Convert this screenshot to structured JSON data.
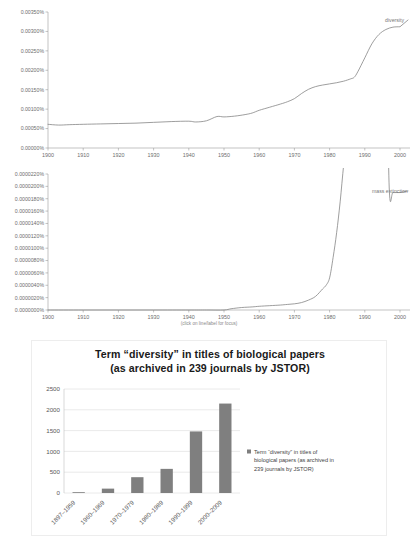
{
  "chart_data": [
    {
      "id": "ngram-diversity",
      "type": "line",
      "title": "",
      "xlabel": "",
      "ylabel": "",
      "caption": "",
      "legend": [
        "diversity"
      ],
      "legend_position": "right-inline",
      "grid": false,
      "xlim": [
        1900,
        2000
      ],
      "ylim": [
        0.0,
        0.0035
      ],
      "xticks": [
        "1900",
        "1910",
        "1920",
        "1930",
        "1940",
        "1950",
        "1960",
        "1970",
        "1980",
        "1990",
        "2000"
      ],
      "yticks": [
        "0.00000%",
        "0.00050%",
        "0.00100%",
        "0.00150%",
        "0.00200%",
        "0.00250%",
        "0.00300%",
        "0.00350%"
      ],
      "series": [
        {
          "name": "diversity",
          "x": [
            1900,
            1903,
            1906,
            1910,
            1915,
            1920,
            1925,
            1930,
            1935,
            1940,
            1942,
            1945,
            1948,
            1950,
            1953,
            1956,
            1958,
            1960,
            1963,
            1966,
            1968,
            1970,
            1972,
            1974,
            1976,
            1978,
            1980,
            1982,
            1984,
            1986,
            1987,
            1988,
            1990,
            1992,
            1994,
            1996,
            1998,
            2000
          ],
          "values": [
            0.00061,
            0.00059,
            0.0006,
            0.00061,
            0.00062,
            0.00063,
            0.00064,
            0.00066,
            0.00068,
            0.00069,
            0.00067,
            0.0007,
            0.00081,
            0.0008,
            0.00082,
            0.00086,
            0.0009,
            0.00097,
            0.00105,
            0.00113,
            0.00119,
            0.00127,
            0.0014,
            0.00151,
            0.00158,
            0.00162,
            0.00165,
            0.00168,
            0.00172,
            0.00178,
            0.00182,
            0.00196,
            0.00232,
            0.00268,
            0.00292,
            0.00305,
            0.00311,
            0.00312
          ]
        }
      ]
    },
    {
      "id": "ngram-mass-extinction",
      "type": "line",
      "title": "",
      "xlabel": "",
      "ylabel": "",
      "caption": "(click on line/label for focus)",
      "legend": [
        "mass extinction"
      ],
      "legend_position": "right-inline",
      "grid": false,
      "xlim": [
        1900,
        2000
      ],
      "ylim": [
        0.0,
        2.2e-06
      ],
      "xticks": [
        "1900",
        "1910",
        "1920",
        "1930",
        "1940",
        "1950",
        "1960",
        "1970",
        "1980",
        "1990",
        "2000"
      ],
      "yticks": [
        "0.0000000%",
        "0.0000020%",
        "0.0000040%",
        "0.0000060%",
        "0.0000080%",
        "0.0000100%",
        "0.0000120%",
        "0.0000140%",
        "0.0000160%",
        "0.0000180%",
        "0.0000200%",
        "0.0000220%"
      ],
      "series": [
        {
          "name": "mass extinction",
          "x": [
            1900,
            1910,
            1920,
            1930,
            1940,
            1945,
            1950,
            1952,
            1955,
            1958,
            1960,
            1963,
            1966,
            1968,
            1970,
            1972,
            1974,
            1976,
            1978,
            1979,
            1980,
            1981,
            1982,
            1983,
            1984,
            1985,
            1986,
            1987,
            1988,
            1990,
            1992,
            1994,
            1996,
            1997,
            1998,
            2000
          ],
          "values": [
            0.0,
            0.0,
            0.0,
            0.0,
            0.0,
            0.0,
            0.0,
            2e-08,
            4e-08,
            5e-08,
            6e-08,
            7e-08,
            8e-08,
            9e-08,
            1e-07,
            1.2e-07,
            1.6e-07,
            2.2e-07,
            3.4e-07,
            4e-07,
            5.2e-07,
            8.5e-07,
            1.25e-06,
            1.75e-06,
            2.35e-06,
            2.85e-06,
            3.2e-06,
            3.45e-06,
            3.62e-06,
            3.78e-06,
            3.82e-06,
            3.85e-06,
            3.9e-06,
            1.9e-06,
            1.9e-06,
            1.9e-06
          ]
        }
      ]
    },
    {
      "id": "jstor-diversity-bars",
      "type": "bar",
      "title": "Term “diversity” in titles of biological papers",
      "subtitle": "(as archived in 239 journals by JSTOR)",
      "xlabel": "",
      "ylabel": "",
      "grid": true,
      "legend_position": "right",
      "legend": [
        "Term “diversity” in titles of biological papers (as archived in 239 journals by JSTOR)"
      ],
      "categories": [
        "1897–1959",
        "1960–1969",
        "1970–1979",
        "1980–1989",
        "1990–1999",
        "2000–2009"
      ],
      "values": [
        15,
        105,
        380,
        580,
        1480,
        2150
      ],
      "yticks": [
        "0",
        "500",
        "1000",
        "1500",
        "2000",
        "2500"
      ],
      "ylim": [
        0,
        2500
      ],
      "series_color": "#7f7f7f"
    }
  ],
  "ngram_top": {
    "legend_label": "diversity",
    "y_axis": {
      "labels": [
        "0.00350%",
        "0.00300%",
        "0.00250%",
        "0.00200%",
        "0.00150%",
        "0.00100%",
        "0.00050%",
        "0.00000%"
      ]
    },
    "x_axis": {
      "labels": [
        "1900",
        "1910",
        "1920",
        "1930",
        "1940",
        "1950",
        "1960",
        "1970",
        "1980",
        "1990",
        "2000"
      ]
    }
  },
  "ngram_bottom": {
    "legend_label": "mass extinction",
    "caption": "(click on line/label for focus)",
    "y_axis": {
      "labels": [
        "0.0000220%",
        "0.0000200%",
        "0.0000180%",
        "0.0000160%",
        "0.0000140%",
        "0.0000120%",
        "0.0000100%",
        "0.0000080%",
        "0.0000060%",
        "0.0000040%",
        "0.0000020%",
        "0.0000000%"
      ]
    },
    "x_axis": {
      "labels": [
        "1900",
        "1910",
        "1920",
        "1930",
        "1940",
        "1950",
        "1960",
        "1970",
        "1980",
        "1990",
        "2000"
      ]
    }
  },
  "bar_panel": {
    "title_line1": "Term “diversity” in titles of biological papers",
    "title_line2": "(as archived in 239 journals by JSTOR)",
    "legend_line1": "Term “diversity” in titles of",
    "legend_line2": "biological papers (as archived in",
    "legend_line3": "239 journals by JSTOR)",
    "y_axis": {
      "labels": [
        "2500",
        "2000",
        "1500",
        "1000",
        "500",
        "0"
      ]
    },
    "x_axis": {
      "labels": [
        "1897–1959",
        "1960–1969",
        "1970–1979",
        "1980–1989",
        "1990–1999",
        "2000–2009"
      ]
    },
    "colors": {
      "bar": "#7f7f7f",
      "grid": "#d9d9d9"
    }
  }
}
